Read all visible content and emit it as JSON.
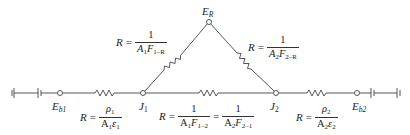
{
  "diagram": {
    "nodes": {
      "Eb1": {
        "label_main": "E",
        "label_sub": "b1",
        "x": 60,
        "y": 93
      },
      "J1": {
        "label_main": "J",
        "label_sub": "1",
        "x": 143,
        "y": 93
      },
      "ER": {
        "label_main": "E",
        "label_sub": "R",
        "x": 209,
        "y": 22
      },
      "J2": {
        "label_main": "J",
        "label_sub": "2",
        "x": 276,
        "y": 93
      },
      "Eb2": {
        "label_main": "E",
        "label_sub": "b2",
        "x": 357,
        "y": 93
      }
    },
    "resistances": {
      "surface1": {
        "lhs": "R",
        "eq": "=",
        "num_main": "ρ",
        "num_sub": "1",
        "den_a": "A",
        "den_a_sub": "1",
        "den_b": "ε",
        "den_b_sub": "1"
      },
      "one_R": {
        "lhs": "R",
        "eq": "=",
        "num": "1",
        "den_a": "A",
        "den_a_sub": "1",
        "den_b": "F",
        "den_b_sub": "1–R"
      },
      "two_R": {
        "lhs": "R",
        "eq": "=",
        "num": "1",
        "den_a": "A",
        "den_a_sub": "2",
        "den_b": "F",
        "den_b_sub": "2–R"
      },
      "one_two": {
        "lhs": "R",
        "eq": "=",
        "num": "1",
        "den_a": "A",
        "den_a_sub": "1",
        "den_b": "F",
        "den_b_sub": "1–2",
        "eq2": "=",
        "num2": "1",
        "den2_a": "A",
        "den2_a_sub": "2",
        "den2_b": "F",
        "den2_b_sub": "2–1"
      },
      "surface2": {
        "lhs": "R",
        "eq": "=",
        "num_main": "ρ",
        "num_sub": "2",
        "den_a": "A",
        "den_a_sub": "2",
        "den_b": "ε",
        "den_b_sub": "2"
      }
    },
    "elements": {
      "battery_left": "battery-icon",
      "battery_right": "battery-icon",
      "resistor": "resistor-zigzag-icon",
      "node": "open-circle-node-icon"
    },
    "colors": {
      "line": "#444444",
      "text": "#222222",
      "background": "#ffffff"
    }
  }
}
